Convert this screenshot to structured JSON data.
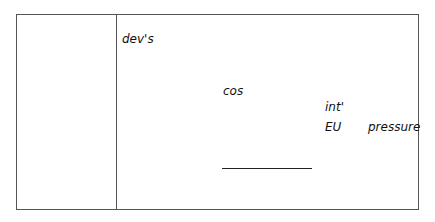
{
  "notes": {
    "left_column": "",
    "labels": {
      "devs": "dev's",
      "cos": "cos",
      "intl": "int'",
      "eu": "EU",
      "pressure": "pressure"
    }
  }
}
